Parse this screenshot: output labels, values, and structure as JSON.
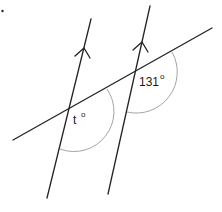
{
  "diagram": {
    "type": "parallel-lines-transversal",
    "colors": {
      "line": "#222222",
      "arc": "#9a9a9a",
      "text": "#1a1a1a"
    },
    "labels": {
      "unknown_angle": "t",
      "unknown_angle_degree": "o",
      "known_angle": "131",
      "known_angle_degree": "o"
    },
    "parallel_lines": [
      {
        "name": "left-parallel-line",
        "from": [
          91,
          19
        ],
        "to": [
          47,
          198
        ],
        "arrow_tip": [
          84,
          48
        ]
      },
      {
        "name": "right-parallel-line",
        "from": [
          150,
          6
        ],
        "to": [
          108,
          194
        ],
        "arrow_tip": [
          142,
          42
        ]
      }
    ],
    "transversal": {
      "from": [
        13,
        140
      ],
      "to": [
        212,
        28
      ]
    },
    "intersections": [
      {
        "name": "left-intersection",
        "point": [
          69,
          110
        ],
        "angle_label": "t°"
      },
      {
        "name": "right-intersection",
        "point": [
          136,
          72
        ],
        "angle_label": "131°"
      }
    ]
  }
}
